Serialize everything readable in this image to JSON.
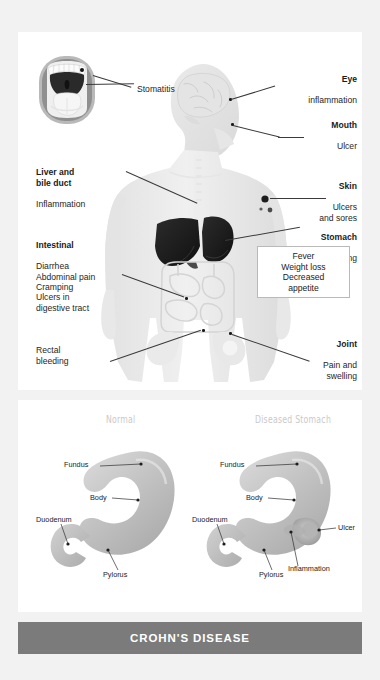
{
  "poster": {
    "footer_title": "CROHN'S DISEASE",
    "banner_color": "#7b7b7b",
    "background_color": "#f2f2f2",
    "card_color": "#ffffff"
  },
  "body_figure": {
    "mouth_photo_label": "Stomatitis",
    "labels": [
      {
        "name": "eye",
        "heading": "Eye",
        "detail": "inflammation"
      },
      {
        "name": "mouth",
        "heading": "Mouth",
        "detail": "Ulcer"
      },
      {
        "name": "skin",
        "heading": "Skin",
        "detail": "Ulcers\nand sores"
      },
      {
        "name": "stomach",
        "heading": "Stomach",
        "detail": "Vomiting"
      },
      {
        "name": "joint",
        "heading": "Joint",
        "detail": "Pain and\nswelling"
      },
      {
        "name": "liver",
        "heading": "Liver and\nbile duct",
        "detail": "Inflammation"
      },
      {
        "name": "intestinal",
        "heading": "Intestinal",
        "detail": "Diarrhea\nAbdominal pain\nCramping\nUlcers in\ndigestive tract"
      },
      {
        "name": "rectal",
        "heading": "",
        "detail": "Rectal\nbleeding"
      }
    ],
    "systemic_box": "Fever\nWeight loss\nDecreased\nappetite"
  },
  "stomach_section": {
    "normal": {
      "heading": "Normal",
      "labels": [
        "Fundus",
        "Duodenum",
        "Body",
        "Pylorus"
      ]
    },
    "diseased": {
      "heading": "Diseased Stomach",
      "labels": [
        "Fundus",
        "Duodenum",
        "Body",
        "Pylorus",
        "Ulcer",
        "Inflammation"
      ]
    }
  }
}
